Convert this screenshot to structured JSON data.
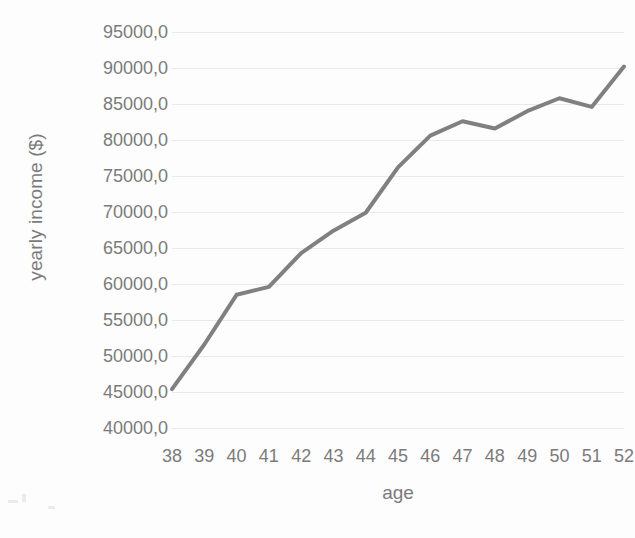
{
  "chart_data": {
    "type": "line",
    "title": "",
    "xlabel": "age",
    "ylabel": "yearly income ($)",
    "x": [
      38,
      39,
      40,
      41,
      42,
      43,
      44,
      45,
      46,
      47,
      48,
      49,
      50,
      51,
      52
    ],
    "categories": [
      "38",
      "39",
      "40",
      "41",
      "42",
      "43",
      "44",
      "45",
      "46",
      "47",
      "48",
      "49",
      "50",
      "51",
      "52"
    ],
    "values": [
      45400,
      51600,
      58500,
      59600,
      64300,
      67400,
      69900,
      76200,
      80600,
      82600,
      81600,
      84000,
      85800,
      84600,
      90200
    ],
    "series": [
      {
        "name": "yearly income",
        "values": [
          45400,
          51600,
          58500,
          59600,
          64300,
          67400,
          69900,
          76200,
          80600,
          82600,
          81600,
          84000,
          85800,
          84600,
          90200
        ]
      }
    ],
    "xlim": [
      38,
      52
    ],
    "ylim": [
      40000,
      95000
    ],
    "ytick_values": [
      95000,
      90000,
      85000,
      80000,
      75000,
      70000,
      65000,
      60000,
      55000,
      50000,
      45000,
      40000
    ],
    "ytick_labels": [
      "95000,0",
      "90000,0",
      "85000,0",
      "80000,0",
      "75000,0",
      "70000,0",
      "65000,0",
      "60000,0",
      "55000,0",
      "50000,0",
      "45000,0",
      "40000,0"
    ],
    "xtick_labels": [
      "38",
      "39",
      "40",
      "41",
      "42",
      "43",
      "44",
      "45",
      "46",
      "47",
      "48",
      "49",
      "50",
      "51",
      "52"
    ],
    "grid": "horizontal",
    "legend": "none",
    "line_color": "#808080",
    "grid_color": "#e9e9e9",
    "text_color": "#7b7b7b",
    "background_color": "#fdfdfd",
    "line_width": 4
  }
}
